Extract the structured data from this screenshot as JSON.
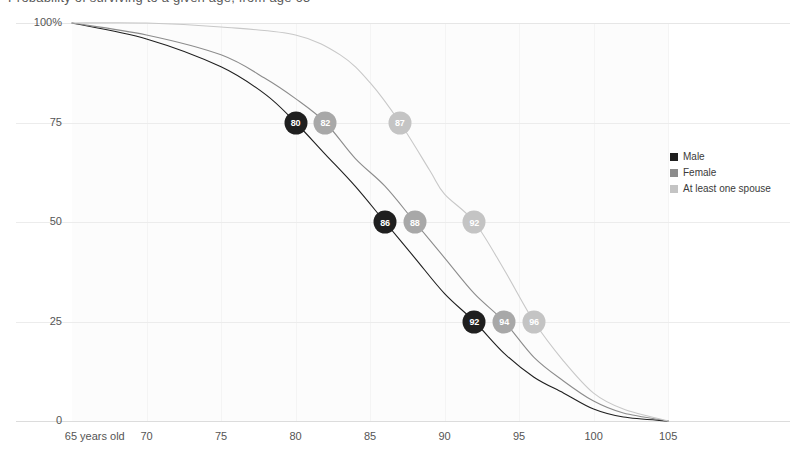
{
  "title": "Probability of surviving to a given age, from age 65",
  "chart_data": {
    "type": "line",
    "title": "Probability of surviving to a given age, from age 65",
    "xlabel": "",
    "ylabel": "",
    "xlim": [
      65,
      106
    ],
    "ylim": [
      0,
      100
    ],
    "grid": true,
    "legend_position": "right",
    "x_ticks": [
      {
        "value": 65,
        "label": "65 years old"
      },
      {
        "value": 70,
        "label": "70"
      },
      {
        "value": 75,
        "label": "75"
      },
      {
        "value": 80,
        "label": "80"
      },
      {
        "value": 85,
        "label": "85"
      },
      {
        "value": 90,
        "label": "90"
      },
      {
        "value": 95,
        "label": "95"
      },
      {
        "value": 100,
        "label": "100"
      },
      {
        "value": 105,
        "label": "105"
      }
    ],
    "y_ticks": [
      {
        "value": 100,
        "label": "100%"
      },
      {
        "value": 75,
        "label": "75"
      },
      {
        "value": 50,
        "label": "50"
      },
      {
        "value": 25,
        "label": "25"
      },
      {
        "value": 0,
        "label": "0"
      }
    ],
    "series": [
      {
        "name": "Male",
        "color": "#1f1f1f",
        "x": [
          65,
          70,
          75,
          78,
          80,
          82,
          84,
          86,
          88,
          90,
          92,
          94,
          96,
          98,
          100,
          102,
          105
        ],
        "values": [
          100,
          96,
          89,
          82,
          75,
          67,
          59,
          50,
          41,
          32,
          25,
          17,
          11,
          7,
          3,
          1,
          0
        ]
      },
      {
        "name": "Female",
        "color": "#8c8c8c",
        "x": [
          65,
          70,
          75,
          78,
          80,
          82,
          84,
          86,
          88,
          90,
          92,
          94,
          96,
          98,
          100,
          102,
          105
        ],
        "values": [
          100,
          97,
          92,
          86,
          81,
          75,
          66,
          59,
          50,
          41,
          32,
          25,
          16,
          10,
          5,
          2,
          0
        ]
      },
      {
        "name": "At least one spouse",
        "color": "#c8c8c8",
        "x": [
          65,
          70,
          75,
          80,
          83,
          85,
          87,
          89,
          90,
          92,
          94,
          96,
          98,
          100,
          102,
          105
        ],
        "values": [
          100,
          100,
          99,
          97,
          92,
          85,
          75,
          63,
          57,
          50,
          38,
          25,
          15,
          7,
          3,
          0
        ]
      }
    ],
    "markers": [
      {
        "series": "Male",
        "age": 80,
        "label": "80",
        "probability": 75,
        "fill": "#1f1f1f"
      },
      {
        "series": "Female",
        "age": 82,
        "label": "82",
        "probability": 75,
        "fill": "#a8a8a8"
      },
      {
        "series": "At least one spouse",
        "age": 87,
        "label": "87",
        "probability": 75,
        "fill": "#c4c4c4"
      },
      {
        "series": "Male",
        "age": 86,
        "label": "86",
        "probability": 50,
        "fill": "#1f1f1f"
      },
      {
        "series": "Female",
        "age": 88,
        "label": "88",
        "probability": 50,
        "fill": "#a8a8a8"
      },
      {
        "series": "At least one spouse",
        "age": 92,
        "label": "92",
        "probability": 50,
        "fill": "#c4c4c4"
      },
      {
        "series": "Male",
        "age": 92,
        "label": "92",
        "probability": 25,
        "fill": "#1f1f1f"
      },
      {
        "series": "Female",
        "age": 94,
        "label": "94",
        "probability": 25,
        "fill": "#a8a8a8"
      },
      {
        "series": "At least one spouse",
        "age": 96,
        "label": "96",
        "probability": 25,
        "fill": "#c4c4c4"
      }
    ],
    "legend": [
      {
        "label": "Male",
        "color": "#1f1f1f"
      },
      {
        "label": "Female",
        "color": "#8c8c8c"
      },
      {
        "label": "At least one spouse",
        "color": "#c4c4c4"
      }
    ]
  }
}
